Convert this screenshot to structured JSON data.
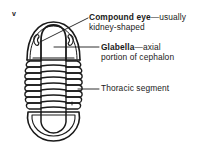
{
  "figure": {
    "panel_letter": "v"
  },
  "labels": [
    {
      "id": "compound-eye",
      "term": "Compound eye",
      "separator": "—",
      "description_line1": "usually",
      "description_line2": "kidney-shaped"
    },
    {
      "id": "glabella",
      "term": "Glabella",
      "separator": "—",
      "description_line1": "axial",
      "description_line2": "portion of cephalon"
    },
    {
      "id": "thoracic-segment",
      "term": "",
      "separator": "",
      "description_line1": "Thoracic segment",
      "description_line2": ""
    }
  ],
  "colors": {
    "ink": "#1a1a1a",
    "background": "#ffffff"
  }
}
